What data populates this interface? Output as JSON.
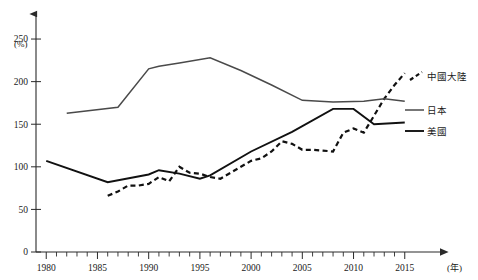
{
  "chart_data": {
    "type": "line",
    "title": "",
    "subtitle": "",
    "xlabel": "(年)",
    "ylabel": "(%)",
    "xlim": [
      1979,
      2016
    ],
    "ylim": [
      0,
      270
    ],
    "yticks": [
      0,
      50,
      100,
      150,
      200,
      250
    ],
    "ytick_labels": [
      "0",
      "50",
      "100",
      "150",
      "200",
      "250"
    ],
    "xticks": [
      1980,
      1985,
      1990,
      1995,
      2000,
      2005,
      2010,
      2015
    ],
    "xtick_labels": [
      "1980",
      "1985",
      "1990",
      "1995",
      "2000",
      "2005",
      "2010",
      "2015"
    ],
    "xtick_minor_step": 1,
    "grid": false,
    "legend_position": "right",
    "series": [
      {
        "name": "中國大陸",
        "style": "dashed",
        "color": "#111111",
        "x": [
          1986,
          1987,
          1988,
          1989,
          1990,
          1991,
          1992,
          1993,
          1994,
          1995,
          1996,
          1997,
          1998,
          1999,
          2000,
          2001,
          2002,
          2003,
          2004,
          2005,
          2006,
          2007,
          2008,
          2009,
          2010,
          2011,
          2012,
          2013,
          2014,
          2015
        ],
        "values": [
          66,
          71,
          78,
          78,
          80,
          88,
          83,
          100,
          93,
          92,
          88,
          86,
          93,
          100,
          107,
          110,
          118,
          130,
          127,
          120,
          120,
          119,
          118,
          140,
          145,
          140,
          160,
          180,
          196,
          210
        ]
      },
      {
        "name": "日本",
        "style": "solid",
        "color": "#4a4a4a",
        "x": [
          1982,
          1987,
          1990,
          1991,
          1993,
          1996,
          1999,
          2002,
          2005,
          2008,
          2011,
          2013,
          2015
        ],
        "values": [
          163,
          170,
          215,
          218,
          222,
          228,
          213,
          196,
          178,
          176,
          177,
          180,
          177
        ]
      },
      {
        "name": "美國",
        "style": "solid",
        "color": "#111111",
        "x": [
          1980,
          1986,
          1990,
          1991,
          1993,
          1995,
          1996,
          2000,
          2004,
          2008,
          2010,
          2012,
          2015
        ],
        "values": [
          107,
          82,
          91,
          96,
          92,
          86,
          90,
          118,
          141,
          168,
          168,
          150,
          152
        ]
      }
    ]
  },
  "legend": {
    "entries": [
      {
        "label": "中國大陸"
      },
      {
        "label": "日本"
      },
      {
        "label": "美國"
      }
    ]
  }
}
